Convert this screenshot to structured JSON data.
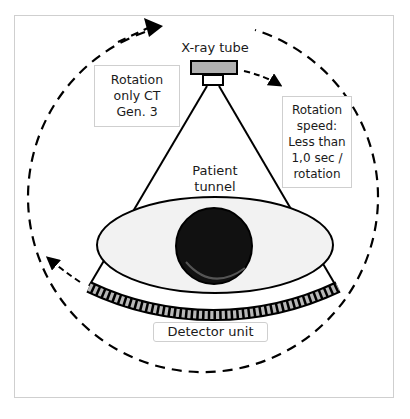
{
  "diagram": {
    "type": "CT scanner third-generation rotation schematic",
    "labels": {
      "xray_tube": "X-ray tube",
      "rotation_only": [
        "Rotation",
        "only CT",
        "Gen. 3"
      ],
      "rotation_speed": [
        "Rotation",
        "speed:",
        "Less than",
        "1,0 sec /",
        "rotation"
      ],
      "patient_tunnel": [
        "Patient",
        "tunnel"
      ],
      "detector_unit": "Detector unit"
    },
    "colors": {
      "line": "#000000",
      "tube_fill": "#b0b0b0",
      "tunnel_fill": "#f2f2f2",
      "detector_cell": "#b8b8b8",
      "box_border": "#cfcfcf"
    },
    "detector_cells": 44,
    "caption_visible": false
  }
}
